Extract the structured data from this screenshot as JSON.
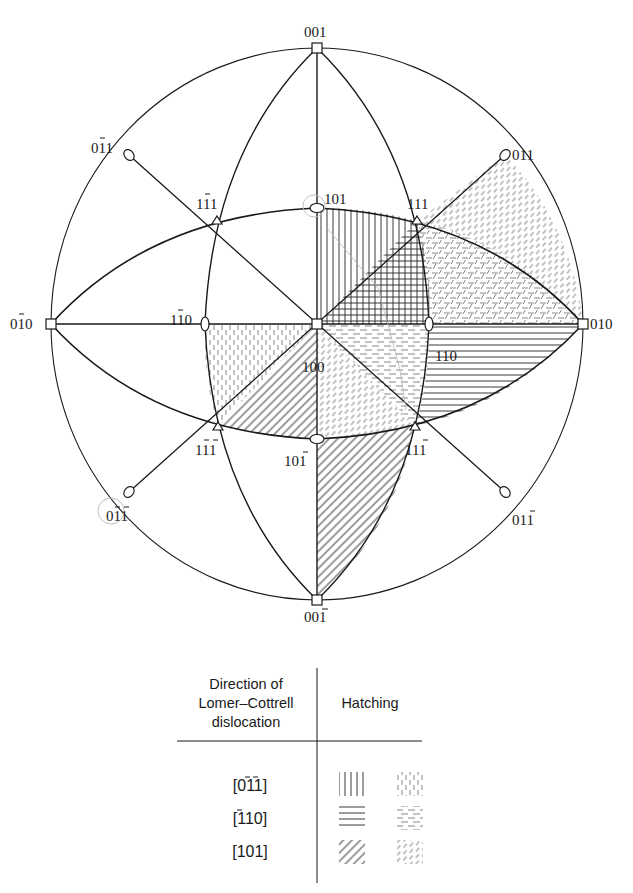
{
  "figure": {
    "type": "stereographic-projection",
    "center_pole": "100",
    "poles": [
      {
        "id": "001",
        "label": "001",
        "x": 317,
        "y": 48,
        "symbol": "square"
      },
      {
        "id": "00-1",
        "label": "001̄",
        "x": 317,
        "y": 600,
        "symbol": "square"
      },
      {
        "id": "0-10",
        "label": "01̄0",
        "x": 51,
        "y": 324,
        "symbol": "square"
      },
      {
        "id": "010",
        "label": "010",
        "x": 583,
        "y": 324,
        "symbol": "square"
      },
      {
        "id": "100",
        "label": "100",
        "x": 317,
        "y": 324,
        "symbol": "square"
      },
      {
        "id": "101",
        "label": "101",
        "x": 317,
        "y": 208,
        "symbol": "ellipse"
      },
      {
        "id": "10-1",
        "label": "101̄",
        "x": 317,
        "y": 439,
        "symbol": "ellipse"
      },
      {
        "id": "1-10",
        "label": "11̄0",
        "x": 205,
        "y": 324,
        "symbol": "ellipse"
      },
      {
        "id": "110",
        "label": "110",
        "x": 429,
        "y": 324,
        "symbol": "ellipse"
      },
      {
        "id": "011",
        "label": "011",
        "x": 505,
        "y": 155,
        "symbol": "ellipse"
      },
      {
        "id": "0-11",
        "label": "01̄1",
        "x": 129,
        "y": 155,
        "symbol": "ellipse"
      },
      {
        "id": "01-1",
        "label": "011̄",
        "x": 505,
        "y": 492,
        "symbol": "ellipse"
      },
      {
        "id": "0-1-1",
        "label": "01̄1̄",
        "x": 129,
        "y": 492,
        "symbol": "ellipse"
      },
      {
        "id": "111",
        "label": "111",
        "x": 417,
        "y": 221,
        "symbol": "triangle"
      },
      {
        "id": "1-11",
        "label": "11̄1",
        "x": 217,
        "y": 221,
        "symbol": "triangle"
      },
      {
        "id": "11-1",
        "label": "111̄",
        "x": 415,
        "y": 426,
        "symbol": "triangle"
      },
      {
        "id": "1-1-1",
        "label": "11̄1̄",
        "x": 218,
        "y": 426,
        "symbol": "triangle"
      }
    ],
    "hatched_regions": [
      {
        "region": "100-101-111",
        "hatching": "solid-vertical",
        "direction": "[01̄1̄]"
      },
      {
        "region": "100-111-110",
        "hatching": "solid-crosshatch",
        "direction": "[01̄1̄] + [1̄10]"
      },
      {
        "region": "111-110-010",
        "hatching": "dashed-horizontal + dashed-diagonal",
        "direction": "[1̄10] + [101]"
      },
      {
        "region": "011-111-010",
        "hatching": "dashed-diagonal",
        "direction": "[101]"
      },
      {
        "region": "100-110-111̄",
        "hatching": "dashed-horizontal + dashed-diagonal",
        "direction": "[1̄10] + [101]"
      },
      {
        "region": "110-010-111̄",
        "hatching": "solid-horizontal",
        "direction": "[1̄10]"
      },
      {
        "region": "100-11̄0-11̄1̄",
        "hatching": "dashed-vertical",
        "direction": "[01̄1̄]"
      },
      {
        "region": "100-11̄1̄-101̄",
        "hatching": "solid-diagonal",
        "direction": "[101]"
      },
      {
        "region": "101̄-111̄-001̄",
        "hatching": "solid-diagonal",
        "direction": "[101]"
      },
      {
        "region": "100-101̄-111̄",
        "hatching": "dashed-diagonal",
        "direction": "[101]"
      }
    ]
  },
  "labels": {
    "p001": "001",
    "p001bar": "001",
    "p0bar10": "010",
    "p010": "010",
    "p100": "100",
    "p101": "101",
    "p101bar": "101",
    "p1bar10": "110",
    "p110": "110",
    "p011": "011",
    "p0bar11": "011",
    "p011bar": "011",
    "p0bar1bar1": "011",
    "p111": "111",
    "p1bar11": "111",
    "p111bar": "111",
    "p1bar1bar1": "111"
  },
  "legend": {
    "header_col1": [
      "Direction of",
      "Lomer–Cottrell",
      "dislocation"
    ],
    "header_col2": "Hatching",
    "rows": [
      {
        "direction": "[011]",
        "direction_display": "[01̄1̄]",
        "solid": "vertical",
        "dashed": "vertical"
      },
      {
        "direction": "[110]",
        "direction_display": "[1̄10]",
        "solid": "horizontal",
        "dashed": "horizontal"
      },
      {
        "direction": "[101]",
        "direction_display": "[101]",
        "solid": "diagonal",
        "dashed": "diagonal"
      }
    ]
  },
  "colors": {
    "ink": "#1a1a1a",
    "light_ink": "#555555",
    "paper": "#ffffff"
  }
}
